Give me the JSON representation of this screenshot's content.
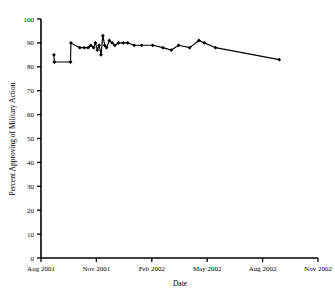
{
  "chart_data": {
    "type": "line",
    "title": "",
    "xlabel": "Date",
    "ylabel": "Percent Approving of Military Action",
    "ylim": [
      0,
      100
    ],
    "ytick_step": 10,
    "yticks": [
      0,
      10,
      20,
      30,
      40,
      50,
      60,
      70,
      80,
      90,
      100
    ],
    "xticks": [
      "Aug 2001",
      "Nov 2001",
      "Feb 2002",
      "May 2002",
      "Aug 2002",
      "Nov 2002"
    ],
    "xlim_months": [
      0,
      15
    ],
    "grid": false,
    "legend": null,
    "marker": "filled-diamond",
    "line_color": "#000000",
    "series": [
      {
        "name": "Percent Approving of Military Action",
        "x_months": [
          0.7,
          0.72,
          1.6,
          1.62,
          2.1,
          2.35,
          2.55,
          2.7,
          2.85,
          2.95,
          3.05,
          3.15,
          3.25,
          3.35,
          3.45,
          3.55,
          3.7,
          3.85,
          4.0,
          4.2,
          4.45,
          4.7,
          5.05,
          5.45,
          6.05,
          6.6,
          7.05,
          7.45,
          8.05,
          8.55,
          8.85,
          9.45,
          12.9
        ],
        "values": [
          85,
          82,
          82,
          90,
          88,
          88,
          88,
          89,
          88,
          90,
          87,
          89,
          85,
          93,
          89,
          88,
          91,
          90,
          89,
          90,
          90,
          90,
          89,
          89,
          89,
          88,
          87,
          89,
          88,
          91,
          90,
          88,
          83
        ]
      }
    ]
  }
}
